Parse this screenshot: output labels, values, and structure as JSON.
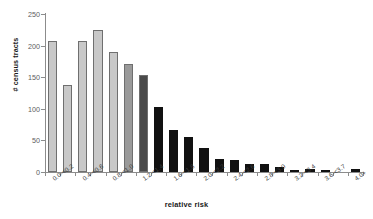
{
  "chart_data": {
    "type": "bar",
    "title": "",
    "subtitle": "",
    "xlabel": "relative risk",
    "ylabel": "# census tracts",
    "ylim": [
      0,
      250
    ],
    "yticks": [
      0,
      50,
      100,
      150,
      200,
      250
    ],
    "ytick_labels": [
      "0",
      "50",
      "100",
      "150",
      "200",
      "250"
    ],
    "grid": false,
    "legend": null,
    "categories": [
      "0.0-<0.2",
      "0.2-<0.4",
      "0.4-<0.6",
      "0.6-<0.8",
      "0.8-<1.0",
      "1.0-<1.2",
      "1.2-<1.4",
      "1.4-<1.6",
      "1.6-<1.8",
      "1.8-<2.0",
      "2.0-<2.2",
      "2.2-<2.4",
      "2.4-<2.6",
      "2.6-<2.8",
      "2.8-<3.0",
      "3.0-<3.2",
      "3.2-<3.4",
      "3.4-<3.6",
      "3.6-<3.7",
      "3.8-<4.0",
      "4.0+"
    ],
    "visible_tick_labels": [
      "0.0-<0.2",
      "0.4-<0.6",
      "0.8-<1.0",
      "1.2-<1.4",
      "1.6-<1.8",
      "2.0-<2.2",
      "2.4-<2.6",
      "2.8-<3.0",
      "3.2-<3.4",
      "3.6-<3.7",
      "4.0+"
    ],
    "values": [
      208,
      137,
      207,
      224,
      190,
      171,
      153,
      103,
      66,
      55,
      38,
      21,
      19,
      13,
      12,
      8,
      2,
      5,
      1,
      0,
      4
    ],
    "bar_colors": [
      "#c8c8c8",
      "#c8c8c8",
      "#c8c8c8",
      "#c8c8c8",
      "#c8c8c8",
      "#9a9a9a",
      "#4a4a4a",
      "#111111",
      "#111111",
      "#111111",
      "#111111",
      "#111111",
      "#111111",
      "#111111",
      "#111111",
      "#111111",
      "#111111",
      "#111111",
      "#111111",
      "#111111",
      "#111111"
    ]
  },
  "colors": {
    "axis": "#8c8c8c",
    "tick_text": "#5d5d5d",
    "title_text": "#1a1a1a",
    "background": "#ffffff",
    "bar_light": "#c8c8c8",
    "bar_mid": "#9a9a9a",
    "bar_dark": "#4a4a4a",
    "bar_black": "#111111"
  }
}
